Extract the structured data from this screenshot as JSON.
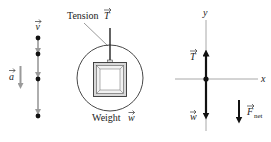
{
  "motion_diagram": {
    "velocity_label": "v",
    "acceleration_label": "a",
    "dot_count": 4,
    "color_gray": "#9a9a9a",
    "color_dot": "#111111"
  },
  "pictorial": {
    "tension_label": "Tension",
    "tension_symbol": "T",
    "weight_label": "Weight",
    "weight_symbol": "w"
  },
  "free_body_diagram": {
    "axis_y_label": "y",
    "axis_x_label": "x",
    "force_up_label": "T",
    "force_down_label": "w",
    "net_force_label": "F",
    "net_force_subscript": "net",
    "axis_color": "#a8a8a8",
    "vector_color": "#111111"
  }
}
